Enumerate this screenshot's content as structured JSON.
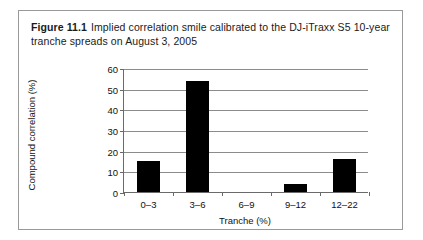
{
  "figure": {
    "label": "Figure 11.1",
    "caption": "Implied correlation smile calibrated to the DJ-iTraxx S5 10-year tranche spreads on August 3, 2005"
  },
  "chart_data": {
    "type": "bar",
    "title": "",
    "categories": [
      "0–3",
      "3–6",
      "6–9",
      "9–12",
      "12–22"
    ],
    "values": [
      15,
      53.5,
      0,
      4,
      16
    ],
    "xlabel": "Tranche (%)",
    "ylabel": "Compound correlation (%)",
    "ylim": [
      0,
      60
    ],
    "yticks": [
      0,
      10,
      20,
      30,
      40,
      50,
      60
    ],
    "ytick_labels": [
      "0",
      "10",
      "20",
      "30",
      "40",
      "50",
      "60"
    ],
    "grid": true,
    "legend": "none",
    "bar_color": "#000000"
  }
}
